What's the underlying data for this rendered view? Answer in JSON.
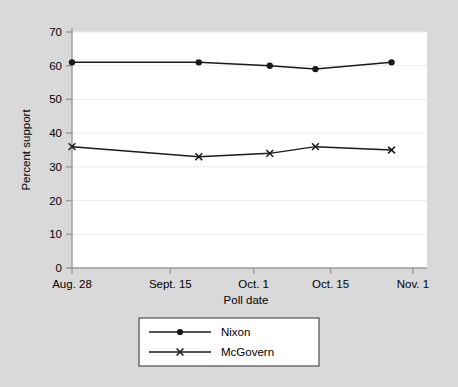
{
  "chart_data": {
    "type": "line",
    "title": "",
    "xlabel": "Poll date",
    "ylabel": "Percent support",
    "ylim": [
      0,
      70
    ],
    "yticks": [
      0,
      10,
      20,
      30,
      40,
      50,
      60,
      70
    ],
    "ytick_labels": [
      "0",
      "10",
      "20",
      "30",
      "40",
      "50",
      "60",
      "70"
    ],
    "xtick_labels": [
      "Aug. 28",
      "Sept. 15",
      "Oct. 1",
      "Oct. 15",
      "Nov. 1"
    ],
    "xtick_positions": [
      0,
      18,
      34,
      48,
      65
    ],
    "xlim": [
      0,
      70
    ],
    "grid": "horizontal",
    "legend_position": "below-center",
    "categories": [
      "Aug. 28",
      "Sept. 22",
      "Oct. 7",
      "Oct. 15",
      "Nov. 4"
    ],
    "x": [
      0,
      25,
      39,
      48,
      63
    ],
    "series": [
      {
        "name": "Nixon",
        "marker": "circle",
        "values": [
          61,
          61,
          60,
          59,
          61
        ]
      },
      {
        "name": "McGovern",
        "marker": "x",
        "values": [
          36,
          33,
          34,
          36,
          35
        ]
      }
    ]
  },
  "legend": {
    "entries": [
      {
        "label": "Nixon",
        "marker": "circle-marker"
      },
      {
        "label": "McGovern",
        "marker": "x-marker"
      }
    ]
  },
  "colors": {
    "figure_background": "#d9d9d9",
    "plot_background": "#ffffff",
    "grid": "#ededed",
    "axis": "#9a9a9a",
    "series_line": "#1a1a1a",
    "text": "#000000",
    "legend_border": "#4d4d4d"
  }
}
